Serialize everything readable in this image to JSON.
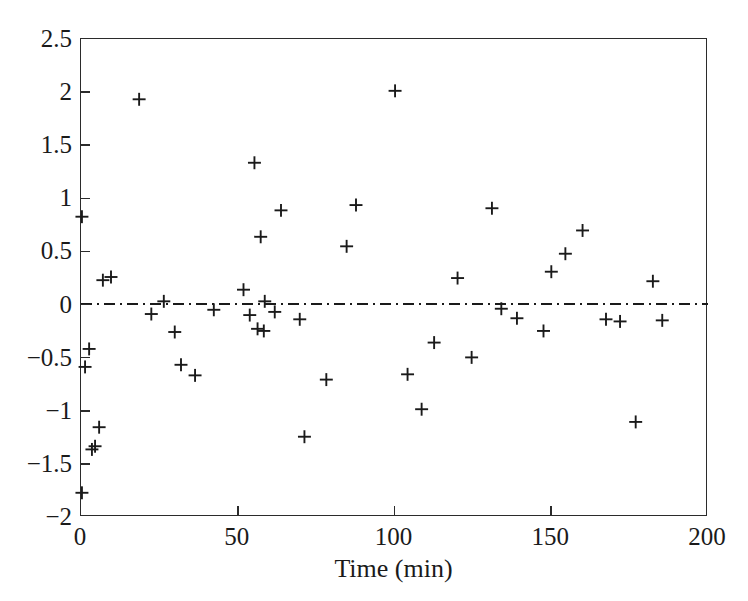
{
  "chart_data": {
    "type": "scatter",
    "title": "",
    "xlabel": "Time (min)",
    "ylabel": "",
    "xlim": [
      0,
      200
    ],
    "ylim": [
      -2,
      2.5
    ],
    "xticks": [
      0,
      50,
      100,
      150,
      200
    ],
    "xtick_labels": [
      "0",
      "50",
      "100",
      "150",
      "200"
    ],
    "yticks": [
      -2,
      -1.5,
      -1,
      -0.5,
      0,
      0.5,
      1,
      1.5,
      2,
      2.5
    ],
    "ytick_labels": [
      "−2",
      "−1.5",
      "−1",
      "−0.5",
      "0",
      "0.5",
      "1",
      "1.5",
      "2",
      "2.5"
    ],
    "grid": false,
    "legend": null,
    "marker": "plus",
    "marker_color": "#1a1a1a",
    "reference_line": {
      "orientation": "horizontal",
      "y": 0,
      "style": "dash-dot",
      "color": "#1a1a1a"
    },
    "series": [
      {
        "name": "residuals",
        "points": [
          [
            0.3,
            0.82
          ],
          [
            0.3,
            -1.79
          ],
          [
            1.3,
            -0.6
          ],
          [
            2.6,
            -0.43
          ],
          [
            3.5,
            -1.38
          ],
          [
            4.5,
            -1.35
          ],
          [
            5.8,
            -1.17
          ],
          [
            7.0,
            0.22
          ],
          [
            9.6,
            0.25
          ],
          [
            18.6,
            1.93
          ],
          [
            22.5,
            -0.1
          ],
          [
            26.5,
            0.02
          ],
          [
            30.0,
            -0.27
          ],
          [
            32.0,
            -0.58
          ],
          [
            36.5,
            -0.68
          ],
          [
            42.5,
            -0.06
          ],
          [
            52.0,
            0.13
          ],
          [
            54.0,
            -0.11
          ],
          [
            55.5,
            1.33
          ],
          [
            56.5,
            -0.24
          ],
          [
            57.5,
            0.63
          ],
          [
            58.5,
            -0.26
          ],
          [
            58.8,
            0.02
          ],
          [
            62.0,
            -0.08
          ],
          [
            64.0,
            0.88
          ],
          [
            70.0,
            -0.15
          ],
          [
            71.5,
            -1.26
          ],
          [
            78.5,
            -0.72
          ],
          [
            85.0,
            0.54
          ],
          [
            88.0,
            0.93
          ],
          [
            100.5,
            2.01
          ],
          [
            104.5,
            -0.67
          ],
          [
            109.0,
            -1.0
          ],
          [
            113.0,
            -0.37
          ],
          [
            120.5,
            0.24
          ],
          [
            125.0,
            -0.51
          ],
          [
            131.5,
            0.9
          ],
          [
            134.5,
            -0.05
          ],
          [
            139.5,
            -0.14
          ],
          [
            148.0,
            -0.26
          ],
          [
            150.5,
            0.3
          ],
          [
            155.0,
            0.47
          ],
          [
            160.5,
            0.69
          ],
          [
            168.0,
            -0.15
          ],
          [
            172.5,
            -0.17
          ],
          [
            177.5,
            -1.12
          ],
          [
            183.0,
            0.21
          ],
          [
            186.0,
            -0.16
          ]
        ]
      }
    ]
  }
}
